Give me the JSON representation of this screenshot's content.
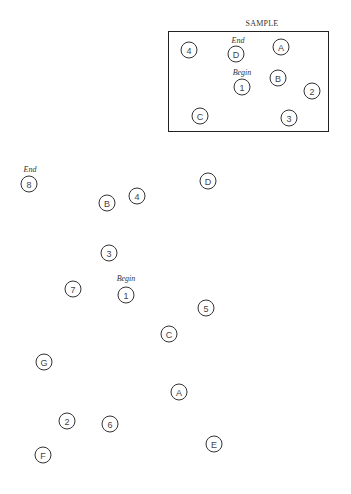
{
  "sample": {
    "title": "SAMPLE",
    "nodes": [
      {
        "label": "4",
        "x": 189,
        "y": 50
      },
      {
        "label": "D",
        "x": 236,
        "y": 54
      },
      {
        "label": "A",
        "x": 281,
        "y": 47
      },
      {
        "label": "1",
        "x": 242,
        "y": 87
      },
      {
        "label": "B",
        "x": 278,
        "y": 78
      },
      {
        "label": "2",
        "x": 312,
        "y": 91
      },
      {
        "label": "C",
        "x": 200,
        "y": 116
      },
      {
        "label": "3",
        "x": 289,
        "y": 118
      }
    ],
    "captions": [
      {
        "text": "End",
        "x": 238,
        "y": 36
      },
      {
        "text": "Begin",
        "x": 242,
        "y": 68
      }
    ]
  },
  "main": {
    "nodes": [
      {
        "label": "8",
        "x": 29,
        "y": 184
      },
      {
        "label": "B",
        "x": 107,
        "y": 203
      },
      {
        "label": "4",
        "x": 137,
        "y": 196
      },
      {
        "label": "D",
        "x": 208,
        "y": 181
      },
      {
        "label": "3",
        "x": 109,
        "y": 253
      },
      {
        "label": "7",
        "x": 73,
        "y": 289
      },
      {
        "label": "1",
        "x": 126,
        "y": 295
      },
      {
        "label": "5",
        "x": 206,
        "y": 308
      },
      {
        "label": "C",
        "x": 169,
        "y": 334
      },
      {
        "label": "G",
        "x": 44,
        "y": 362
      },
      {
        "label": "A",
        "x": 179,
        "y": 392
      },
      {
        "label": "2",
        "x": 67,
        "y": 421
      },
      {
        "label": "6",
        "x": 110,
        "y": 424
      },
      {
        "label": "E",
        "x": 214,
        "y": 444
      },
      {
        "label": "F",
        "x": 43,
        "y": 455
      }
    ],
    "captions": [
      {
        "text": "End",
        "x": 30,
        "y": 165
      },
      {
        "text": "Begin",
        "x": 126,
        "y": 274
      }
    ]
  }
}
